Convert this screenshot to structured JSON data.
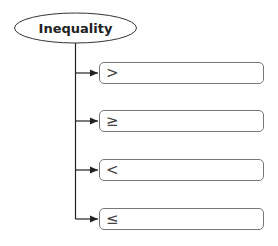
{
  "diagram": {
    "root": {
      "label": "Inequality"
    },
    "children": [
      {
        "symbol": ">"
      },
      {
        "symbol": "≥"
      },
      {
        "symbol": "<"
      },
      {
        "symbol": "≤"
      }
    ]
  }
}
